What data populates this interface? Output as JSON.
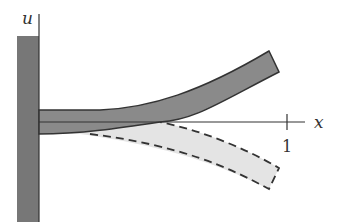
{
  "diagram": {
    "labels": {
      "vertical_axis": "u",
      "horizontal_axis": "x",
      "tick_value": "1"
    },
    "elements": {
      "wall": "clamped support (fixed wall)",
      "deflected_up": "beam deflected upward (solid, dark gray)",
      "deflected_down": "beam deflected downward (dashed outline, light gray)",
      "axis": "undeformed beam axis"
    },
    "colors": {
      "wall_fill": "#777777",
      "beam_up_fill": "#8a8a8a",
      "beam_down_fill": "#e4e4e4",
      "stroke": "#333333",
      "background": "#ffffff"
    }
  }
}
